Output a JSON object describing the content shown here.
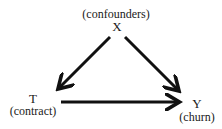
{
  "diagram": {
    "type": "causal-dag",
    "nodes": [
      {
        "id": "X",
        "symbol": "X",
        "description": "(confounders)"
      },
      {
        "id": "T",
        "symbol": "T",
        "description": "(contract)"
      },
      {
        "id": "Y",
        "symbol": "Y",
        "description": "(churn)"
      }
    ],
    "edges": [
      {
        "from": "X",
        "to": "T"
      },
      {
        "from": "X",
        "to": "Y"
      },
      {
        "from": "T",
        "to": "Y"
      }
    ],
    "colors": {
      "arrow": "#111111",
      "text": "#1a1a1a",
      "background": "#ffffff"
    }
  }
}
